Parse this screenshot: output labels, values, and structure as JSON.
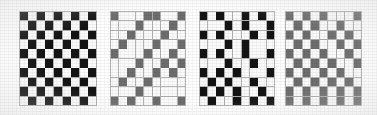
{
  "figure": {
    "title": "",
    "background_color": "#ffffff",
    "panel_count": 4,
    "grid_line_color": "#b4b4b4",
    "colors": {
      "white_cell": "#fbfbfb",
      "black_cell": "#141414",
      "gray_cell": "#6e6e6e"
    },
    "panels": [
      {
        "label": "",
        "name": "checkerboard-panel-1",
        "rows": 10,
        "cols": 9,
        "left": 19,
        "top": 11,
        "width": 78,
        "height": 95,
        "palette": [
          "w",
          "k"
        ],
        "cells": [
          [
            "k",
            "w",
            "k",
            "w",
            "k",
            "w",
            "k",
            "w",
            "k"
          ],
          [
            "w",
            "k",
            "w",
            "k",
            "w",
            "k",
            "w",
            "k",
            "w"
          ],
          [
            "k",
            "w",
            "k",
            "w",
            "k",
            "w",
            "k",
            "w",
            "k"
          ],
          [
            "w",
            "k",
            "w",
            "k",
            "w",
            "k",
            "w",
            "k",
            "w"
          ],
          [
            "k",
            "w",
            "k",
            "w",
            "k",
            "w",
            "k",
            "w",
            "k"
          ],
          [
            "w",
            "k",
            "w",
            "k",
            "w",
            "k",
            "w",
            "k",
            "w"
          ],
          [
            "k",
            "w",
            "k",
            "w",
            "k",
            "w",
            "k",
            "w",
            "k"
          ],
          [
            "w",
            "k",
            "w",
            "k",
            "w",
            "k",
            "w",
            "k",
            "w"
          ],
          [
            "k",
            "w",
            "k",
            "w",
            "k",
            "w",
            "k",
            "w",
            "k"
          ],
          [
            "w",
            "k",
            "w",
            "k",
            "w",
            "k",
            "w",
            "k",
            "w"
          ]
        ]
      },
      {
        "label": "",
        "name": "diagonal-gray-panel-2",
        "rows": 10,
        "cols": 9,
        "left": 110,
        "top": 11,
        "width": 76,
        "height": 95,
        "palette": [
          "w",
          "g"
        ],
        "cells": [
          [
            "g",
            "w",
            "w",
            "w",
            "g",
            "g",
            "w",
            "w",
            "g"
          ],
          [
            "w",
            "w",
            "w",
            "g",
            "w",
            "w",
            "w",
            "g",
            "w"
          ],
          [
            "w",
            "w",
            "g",
            "w",
            "w",
            "w",
            "g",
            "w",
            "w"
          ],
          [
            "w",
            "g",
            "w",
            "w",
            "w",
            "g",
            "w",
            "w",
            "g"
          ],
          [
            "g",
            "w",
            "w",
            "w",
            "g",
            "w",
            "w",
            "g",
            "w"
          ],
          [
            "w",
            "w",
            "w",
            "g",
            "w",
            "w",
            "g",
            "w",
            "g"
          ],
          [
            "w",
            "w",
            "g",
            "w",
            "w",
            "g",
            "w",
            "g",
            "w"
          ],
          [
            "w",
            "g",
            "w",
            "w",
            "g",
            "w",
            "w",
            "w",
            "w"
          ],
          [
            "w",
            "w",
            "w",
            "g",
            "w",
            "w",
            "w",
            "w",
            "w"
          ],
          [
            "g",
            "w",
            "g",
            "w",
            "w",
            "g",
            "w",
            "w",
            "g"
          ]
        ]
      },
      {
        "label": "",
        "name": "scattered-black-panel-3",
        "rows": 10,
        "cols": 9,
        "left": 199,
        "top": 11,
        "width": 76,
        "height": 95,
        "palette": [
          "w",
          "k"
        ],
        "cells": [
          [
            "k",
            "w",
            "k",
            "w",
            "w",
            "k",
            "w",
            "k",
            "w"
          ],
          [
            "w",
            "w",
            "w",
            "k",
            "w",
            "k",
            "w",
            "w",
            "k"
          ],
          [
            "k",
            "w",
            "k",
            "w",
            "w",
            "w",
            "k",
            "w",
            "k"
          ],
          [
            "w",
            "w",
            "w",
            "k",
            "w",
            "k",
            "w",
            "w",
            "w"
          ],
          [
            "k",
            "w",
            "k",
            "w",
            "w",
            "k",
            "w",
            "w",
            "k"
          ],
          [
            "w",
            "w",
            "w",
            "k",
            "w",
            "w",
            "k",
            "w",
            "w"
          ],
          [
            "k",
            "w",
            "k",
            "w",
            "k",
            "w",
            "w",
            "w",
            "k"
          ],
          [
            "w",
            "k",
            "w",
            "k",
            "w",
            "w",
            "k",
            "w",
            "w"
          ],
          [
            "k",
            "w",
            "k",
            "w",
            "k",
            "w",
            "w",
            "k",
            "w"
          ],
          [
            "w",
            "k",
            "w",
            "w",
            "k",
            "w",
            "k",
            "w",
            "k"
          ]
        ]
      },
      {
        "label": "",
        "name": "gray-checkerboard-panel-4",
        "rows": 10,
        "cols": 9,
        "left": 285,
        "top": 11,
        "width": 77,
        "height": 95,
        "palette": [
          "w",
          "g"
        ],
        "cells": [
          [
            "g",
            "w",
            "g",
            "w",
            "g",
            "w",
            "w",
            "w",
            "g"
          ],
          [
            "w",
            "g",
            "w",
            "g",
            "w",
            "w",
            "g",
            "w",
            "w"
          ],
          [
            "g",
            "w",
            "g",
            "w",
            "w",
            "g",
            "w",
            "g",
            "w"
          ],
          [
            "w",
            "g",
            "w",
            "g",
            "w",
            "w",
            "g",
            "w",
            "g"
          ],
          [
            "g",
            "w",
            "g",
            "w",
            "g",
            "w",
            "w",
            "g",
            "w"
          ],
          [
            "w",
            "g",
            "w",
            "g",
            "w",
            "g",
            "w",
            "w",
            "g"
          ],
          [
            "g",
            "w",
            "g",
            "w",
            "g",
            "w",
            "g",
            "w",
            "w"
          ],
          [
            "w",
            "g",
            "w",
            "g",
            "w",
            "g",
            "w",
            "g",
            "w"
          ],
          [
            "g",
            "w",
            "g",
            "w",
            "g",
            "w",
            "g",
            "w",
            "g"
          ],
          [
            "g",
            "w",
            "g",
            "w",
            "g",
            "w",
            "g",
            "w",
            "g"
          ]
        ]
      }
    ]
  }
}
